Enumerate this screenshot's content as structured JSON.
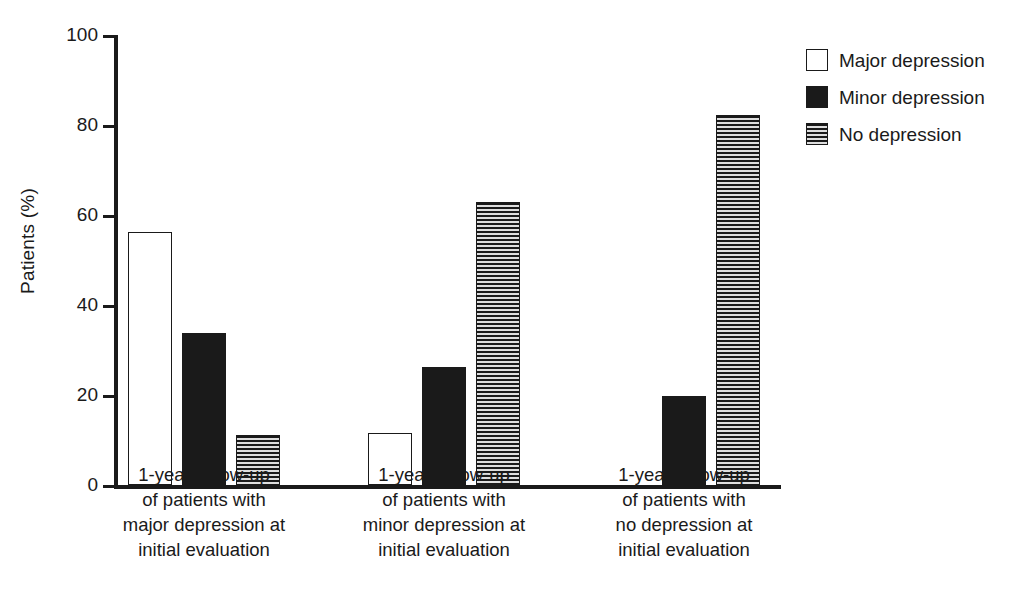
{
  "chart_data": {
    "type": "bar",
    "title": "",
    "xlabel": "",
    "ylabel": "Patients (%)",
    "ylim": [
      0,
      100
    ],
    "ytick_labels": [
      "0",
      "20",
      "40",
      "60",
      "80",
      "100"
    ],
    "ytick_values": [
      0,
      20,
      40,
      60,
      80,
      100
    ],
    "grid": false,
    "legend_position": "right-top",
    "categories": [
      "1-year follow-up\nof patients with\nmajor depression at\ninitial evaluation",
      "1-year follow-up\nof patients with\nminor depression at\ninitial evaluation",
      "1-year follow-up\nof patients with\nno depression at\ninitial evaluation"
    ],
    "series": [
      {
        "name": "Major depression",
        "fill": "open",
        "values": [
          56.3,
          11.5,
          0
        ]
      },
      {
        "name": "Minor depression",
        "fill": "solid",
        "values": [
          33.7,
          26.2,
          19.8
        ]
      },
      {
        "name": "No depression",
        "fill": "striped",
        "values": [
          11.2,
          63.0,
          82.2
        ]
      }
    ]
  },
  "legend": {
    "items": [
      {
        "label": "Major depression",
        "fill": "open"
      },
      {
        "label": "Minor depression",
        "fill": "solid"
      },
      {
        "label": "No depression",
        "fill": "striped"
      }
    ]
  },
  "colors": {
    "ink": "#1a1a1a",
    "background": "#ffffff",
    "stripe_light": "#dedede"
  }
}
